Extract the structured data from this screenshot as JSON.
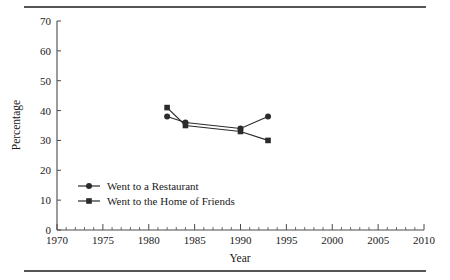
{
  "figure": {
    "top_rule": "horizontal-rule",
    "bottom_rule": "horizontal-rule"
  },
  "chart_data": {
    "type": "line",
    "title": "",
    "xlabel": "Year",
    "ylabel": "Percentage",
    "xlim": [
      1970,
      2010
    ],
    "ylim": [
      0,
      70
    ],
    "xticks": [
      1970,
      1975,
      1980,
      1985,
      1990,
      1995,
      2000,
      2005,
      2010
    ],
    "xtick_labels": [
      "1970",
      "1975",
      "1980",
      "1985",
      "1990",
      "1995",
      "2000",
      "2005",
      "2010"
    ],
    "yticks": [
      0,
      10,
      20,
      30,
      40,
      50,
      60,
      70
    ],
    "ytick_labels": [
      "0",
      "10",
      "20",
      "30",
      "40",
      "50",
      "60",
      "70"
    ],
    "x_minor_tick_interval": 1,
    "grid": false,
    "legend_position": "inside lower-left",
    "series": [
      {
        "name": "Went to a Restaurant",
        "marker": "circle",
        "color": "#2b2b2b",
        "x": [
          1982,
          1984,
          1990,
          1993
        ],
        "values": [
          38,
          36,
          34,
          38
        ]
      },
      {
        "name": "Went to the Home of Friends",
        "marker": "square",
        "color": "#2b2b2b",
        "x": [
          1982,
          1984,
          1990,
          1993
        ],
        "values": [
          41,
          35,
          33,
          30
        ]
      }
    ]
  },
  "legend": {
    "items": [
      {
        "label": "Went to a Restaurant",
        "marker": "circle"
      },
      {
        "label": "Went to the Home of Friends",
        "marker": "square"
      }
    ]
  },
  "colors": {
    "ink": "#1a1a1a",
    "axis": "#4a4a4a",
    "series": "#2b2b2b",
    "rule": "#555555",
    "background": "#ffffff"
  }
}
